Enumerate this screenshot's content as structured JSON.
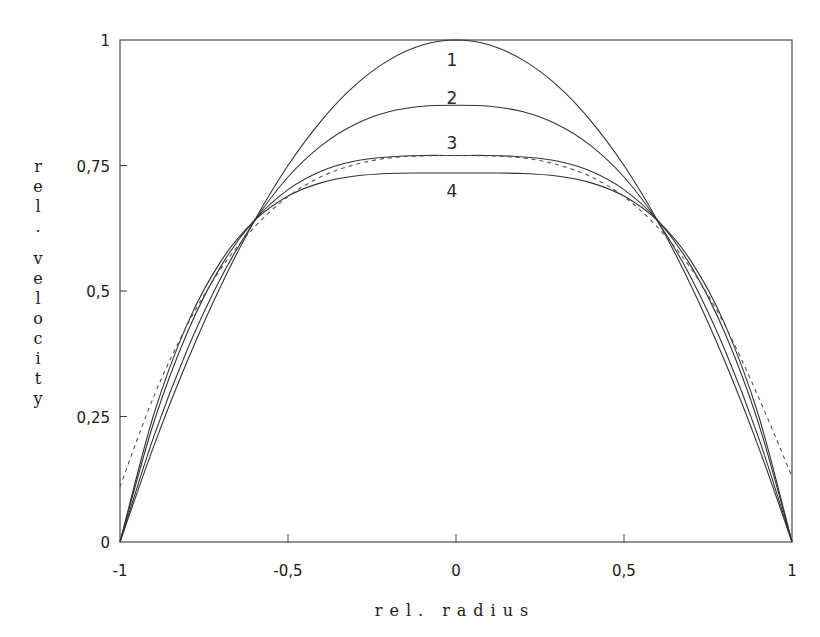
{
  "chart_data": {
    "type": "line",
    "title": "",
    "xlabel": "rel. radius",
    "ylabel": "rel. velocity",
    "xlim": [
      -1,
      1
    ],
    "ylim": [
      0,
      1
    ],
    "grid": false,
    "legend": "inline curve labels 1-4 near centerline",
    "x_ticks": [
      {
        "value": -1,
        "label": "-1"
      },
      {
        "value": -0.5,
        "label": "-0,5"
      },
      {
        "value": 0,
        "label": "0"
      },
      {
        "value": 0.5,
        "label": "0,5"
      },
      {
        "value": 1,
        "label": "1"
      }
    ],
    "y_ticks": [
      {
        "value": 0,
        "label": "0"
      },
      {
        "value": 0.25,
        "label": "0,25"
      },
      {
        "value": 0.5,
        "label": "0,5"
      },
      {
        "value": 0.75,
        "label": "0,75"
      },
      {
        "value": 1,
        "label": "1"
      }
    ],
    "x": [
      -1,
      -0.9,
      -0.8,
      -0.7,
      -0.6,
      -0.5,
      -0.4,
      -0.3,
      -0.2,
      -0.1,
      0,
      0.1,
      0.2,
      0.3,
      0.4,
      0.5,
      0.6,
      0.7,
      0.8,
      0.9,
      1
    ],
    "series": [
      {
        "name": "1",
        "style": "solid",
        "label_pos": [
          0,
          0.96
        ],
        "values": [
          0,
          0.19,
          0.36,
          0.51,
          0.64,
          0.75,
          0.84,
          0.91,
          0.96,
          0.99,
          1,
          0.99,
          0.96,
          0.91,
          0.84,
          0.75,
          0.64,
          0.51,
          0.36,
          0.19,
          0
        ]
      },
      {
        "name": "2",
        "style": "solid",
        "label_pos": [
          0,
          0.885
        ],
        "values": [
          0,
          0.209,
          0.383,
          0.526,
          0.639,
          0.727,
          0.79,
          0.832,
          0.857,
          0.868,
          0.87,
          0.868,
          0.857,
          0.832,
          0.79,
          0.727,
          0.639,
          0.526,
          0.383,
          0.209,
          0
        ]
      },
      {
        "name": "3",
        "style": "solid",
        "label_pos": [
          0,
          0.795
        ],
        "values": [
          0,
          0.237,
          0.417,
          0.549,
          0.641,
          0.702,
          0.739,
          0.759,
          0.767,
          0.77,
          0.77,
          0.77,
          0.767,
          0.759,
          0.739,
          0.702,
          0.641,
          0.549,
          0.417,
          0.237,
          0
        ]
      },
      {
        "name": "4",
        "style": "solid",
        "label_pos": [
          0,
          0.7
        ],
        "values": [
          0,
          0.253,
          0.434,
          0.559,
          0.64,
          0.689,
          0.716,
          0.729,
          0.734,
          0.735,
          0.735,
          0.735,
          0.734,
          0.729,
          0.716,
          0.689,
          0.64,
          0.559,
          0.434,
          0.253,
          0
        ]
      },
      {
        "name": "reference (dashed)",
        "style": "dashed",
        "label_pos": null,
        "values": [
          0.11,
          0.289,
          0.432,
          0.544,
          0.627,
          0.688,
          0.728,
          0.752,
          0.765,
          0.769,
          0.77,
          0.769,
          0.765,
          0.752,
          0.728,
          0.688,
          0.627,
          0.544,
          0.432,
          0.289,
          0.13
        ]
      }
    ]
  },
  "plot_area": {
    "left": 120,
    "right": 792,
    "top": 40,
    "bottom": 542
  }
}
